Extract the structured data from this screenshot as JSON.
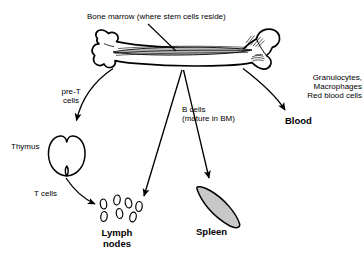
{
  "figure": {
    "background_color": "#ffffff",
    "stroke_color": "#000000",
    "spleen_fill_color": "#c8c8c8",
    "marrow_fill_color": "#9a9a9a"
  },
  "labels": {
    "bone_marrow": "Bone marrow (where stem cells reside)",
    "pre_t_cells": "pre-T\ncells",
    "b_cells": "B cells\n(mature in BM)",
    "blood_lineages": "Granulocytes,\nMacrophages\nRed blood cells",
    "blood": "Blood",
    "thymus": "Thymus",
    "t_cells": "T cells",
    "lymph_nodes": "Lymph\nnodes",
    "spleen": "Spleen"
  },
  "structures": [
    {
      "name": "bone",
      "label": "Bone marrow (where stem cells reside)"
    },
    {
      "name": "thymus",
      "label": "Thymus"
    },
    {
      "name": "lymph-nodes",
      "label": "Lymph nodes",
      "node_count": 7
    },
    {
      "name": "spleen",
      "label": "Spleen"
    }
  ],
  "arrows": [
    {
      "name": "pre-t-cells-arrow",
      "from": "bone",
      "to": "thymus",
      "label": "pre-T cells"
    },
    {
      "name": "t-cells-arrow",
      "from": "thymus",
      "to": "lymph-nodes",
      "label": "T cells"
    },
    {
      "name": "b-cells-lymph-arrow",
      "from": "bone",
      "to": "lymph-nodes",
      "label": "B cells (mature in BM)"
    },
    {
      "name": "b-cells-spleen-arrow",
      "from": "bone",
      "to": "spleen",
      "label": "B cells (mature in BM)"
    },
    {
      "name": "blood-arrow",
      "from": "bone",
      "to": "blood",
      "label": "Granulocytes, Macrophages, Red blood cells"
    }
  ]
}
